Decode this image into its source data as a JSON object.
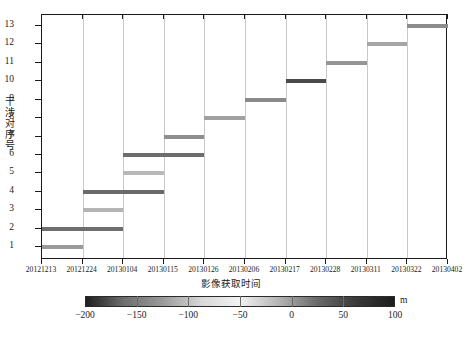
{
  "chart_data": {
    "type": "bar",
    "title": "",
    "subtitle": "",
    "xlabel": "影像获取时间",
    "ylabel": "干涉对序号",
    "orientation": "horizontal",
    "grid": "vertical-only",
    "legend": "none",
    "ylim": [
      0.3,
      13.6
    ],
    "yticks": [
      1,
      2,
      3,
      4,
      5,
      6,
      7,
      8,
      9,
      10,
      11,
      12,
      13
    ],
    "ytick_labels": [
      "1",
      "2",
      "3",
      "4",
      "5",
      "6",
      "7",
      "8",
      "9",
      "10",
      "11",
      "12",
      "13"
    ],
    "xtick_labels": [
      "20121213",
      "20121224",
      "20130104",
      "20130115",
      "20130126",
      "20130206",
      "20130217",
      "20130228",
      "20130311",
      "20130322",
      "20130402"
    ],
    "xlim_labels": [
      "20121213",
      "20130402"
    ],
    "series": [
      {
        "name": "干涉对基线跨度",
        "values": [
          {
            "pair": 1,
            "start": "20121213",
            "end": "20121224",
            "start_frac": 0.0,
            "end_frac": 0.1,
            "color": "#9a9a9a",
            "perp_baseline_m": -125
          },
          {
            "pair": 2,
            "start": "20121213",
            "end": "20130104",
            "start_frac": 0.0,
            "end_frac": 0.2,
            "color": "#6e6e6e",
            "perp_baseline_m": -55
          },
          {
            "pair": 3,
            "start": "20121224",
            "end": "20130104",
            "start_frac": 0.1,
            "end_frac": 0.2,
            "color": "#b4b4b4",
            "perp_baseline_m": -150
          },
          {
            "pair": 4,
            "start": "20121224",
            "end": "20130115",
            "start_frac": 0.1,
            "end_frac": 0.3,
            "color": "#6a6a6a",
            "perp_baseline_m": -50
          },
          {
            "pair": 5,
            "start": "20130104",
            "end": "20130115",
            "start_frac": 0.2,
            "end_frac": 0.3,
            "color": "#b8b8b8",
            "perp_baseline_m": -155
          },
          {
            "pair": 6,
            "start": "20130104",
            "end": "20130126",
            "start_frac": 0.2,
            "end_frac": 0.4,
            "color": "#6d6d6d",
            "perp_baseline_m": -52
          },
          {
            "pair": 7,
            "start": "20130115",
            "end": "20130126",
            "start_frac": 0.3,
            "end_frac": 0.4,
            "color": "#8e8e8e",
            "perp_baseline_m": -110
          },
          {
            "pair": 8,
            "start": "20130126",
            "end": "20130206",
            "start_frac": 0.4,
            "end_frac": 0.5,
            "color": "#a0a0a0",
            "perp_baseline_m": -130
          },
          {
            "pair": 9,
            "start": "20130206",
            "end": "20130217",
            "start_frac": 0.5,
            "end_frac": 0.6,
            "color": "#8a8a8a",
            "perp_baseline_m": -105
          },
          {
            "pair": 10,
            "start": "20130217",
            "end": "20130228",
            "start_frac": 0.6,
            "end_frac": 0.7,
            "color": "#4a4a4a",
            "perp_baseline_m": -10
          },
          {
            "pair": 11,
            "start": "20130228",
            "end": "20130311",
            "start_frac": 0.7,
            "end_frac": 0.8,
            "color": "#969696",
            "perp_baseline_m": -120
          },
          {
            "pair": 12,
            "start": "20130311",
            "end": "20130322",
            "start_frac": 0.8,
            "end_frac": 0.9,
            "color": "#a6a6a6",
            "perp_baseline_m": -138
          },
          {
            "pair": 13,
            "start": "20130322",
            "end": "20130402",
            "start_frac": 0.9,
            "end_frac": 1.0,
            "color": "#8c8c8c",
            "perp_baseline_m": -108
          }
        ]
      }
    ],
    "colorbar": {
      "unit": "m",
      "ticks": [
        -200,
        -150,
        -100,
        -50,
        0,
        50,
        100
      ],
      "tick_labels": [
        "−200",
        "−150",
        "−100",
        "−50",
        "0",
        "50",
        "100"
      ],
      "range": [
        -200,
        100
      ],
      "colormap": "gray-bright-midpoint",
      "stops": [
        "#1e1e1e",
        "#6f6f6f",
        "#9a9a9a",
        "#d8d8d8",
        "#f2f2f2",
        "#b4b4b4",
        "#6a6a6a",
        "#3a3a3a",
        "#1c1c1c"
      ]
    }
  }
}
